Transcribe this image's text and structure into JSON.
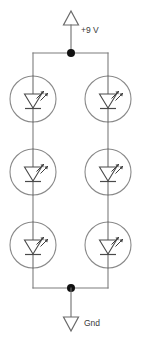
{
  "diagram": {
    "type": "schematic",
    "background_color": "#ffffff",
    "wire_color": "#7d7d7d",
    "symbol_color": "#4a4a4a",
    "node_color": "#111111",
    "labels": {
      "supply": "+9 V",
      "ground": "Gnd"
    },
    "terminals": [
      {
        "id": "supply",
        "name": "power-supply-terminal",
        "label": "+9 V",
        "symbol": "up-triangle",
        "x": 71,
        "y": 18
      },
      {
        "id": "ground",
        "name": "ground-terminal",
        "label": "Gnd",
        "symbol": "down-triangle",
        "x": 71,
        "y": 325
      }
    ],
    "nodes": [
      {
        "id": "vcc-node",
        "name": "supply-junction-node",
        "x": 71,
        "y": 53
      },
      {
        "id": "gnd-node",
        "name": "ground-junction-node",
        "x": 71,
        "y": 288
      }
    ],
    "rails": [
      {
        "id": "top-rail",
        "name": "top-rail-wire",
        "y": 53,
        "x1": 33,
        "x2": 108
      },
      {
        "id": "bottom-rail",
        "name": "bottom-rail-wire",
        "y": 288,
        "x1": 33,
        "x2": 108
      }
    ],
    "branches": [
      {
        "id": "left-branch",
        "name": "left-led-branch",
        "x": 33,
        "component_count": 3
      },
      {
        "id": "right-branch",
        "name": "right-led-branch",
        "x": 108,
        "component_count": 3
      }
    ],
    "components": [
      {
        "id": "led-l1",
        "name": "led-left-top",
        "type": "LED",
        "branch": "left-branch",
        "cx": 33,
        "cy": 99,
        "r": 23
      },
      {
        "id": "led-l2",
        "name": "led-left-middle",
        "type": "LED",
        "branch": "left-branch",
        "cx": 33,
        "cy": 172,
        "r": 23
      },
      {
        "id": "led-l3",
        "name": "led-left-bottom",
        "type": "LED",
        "branch": "left-branch",
        "cx": 33,
        "cy": 245,
        "r": 23
      },
      {
        "id": "led-r1",
        "name": "led-right-top",
        "type": "LED",
        "branch": "right-branch",
        "cx": 108,
        "cy": 99,
        "r": 23
      },
      {
        "id": "led-r2",
        "name": "led-right-middle",
        "type": "LED",
        "branch": "right-branch",
        "cx": 108,
        "cy": 172,
        "r": 23
      },
      {
        "id": "led-r3",
        "name": "led-right-bottom",
        "type": "LED",
        "branch": "right-branch",
        "cx": 108,
        "cy": 245,
        "r": 23
      }
    ]
  }
}
